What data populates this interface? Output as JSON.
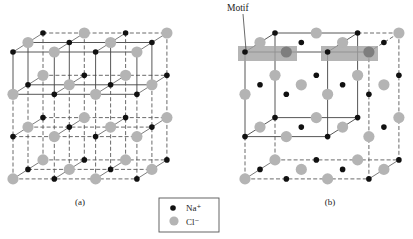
{
  "figure": {
    "canvas": {
      "width": 413,
      "height": 239,
      "background": "#ffffff"
    },
    "colors": {
      "na_atom": "#111111",
      "cl_atom": "#b4b4b4",
      "cl_atom_in_motif": "#7e7e7e",
      "line": "#444444",
      "dashed_line": "#5a5a5a",
      "motif_box": "#a3a3a3",
      "legend_border": "#555555"
    },
    "atom_radius": {
      "na": 2.8,
      "cl": 5.6
    },
    "lattice": {
      "size": {
        "x": 4,
        "y": 4,
        "z": 3
      },
      "step_x": [
        41.3,
        0
      ],
      "step_y": [
        0,
        42.3
      ],
      "step_z": [
        15,
        -9.5
      ],
      "coloring_rule": "Na+ where (i+j+k) is even, Cl- otherwise"
    },
    "panels": [
      {
        "id": "a",
        "label": "(a)",
        "label_pos": [
          80,
          205
        ],
        "origin": [
          13,
          52
        ],
        "edges": [
          {
            "axis": "x",
            "range": [
              0,
              3
            ],
            "at": [
              [
                0,
                1
              ],
              [
                0,
                1
              ]
            ],
            "style": "solid"
          },
          {
            "axis": "x",
            "range": [
              0,
              3
            ],
            "at": [
              [
                0,
                1
              ],
              [
                2
              ]
            ],
            "style": "dashed"
          },
          {
            "axis": "x",
            "range": [
              0,
              3
            ],
            "at": [
              [
                2,
                3
              ],
              [
                0,
                1,
                2
              ]
            ],
            "style": "dashed"
          },
          {
            "axis": "y",
            "range": [
              0,
              1
            ],
            "at": [
              [
                0,
                1,
                2,
                3
              ],
              [
                0,
                1
              ]
            ],
            "style": "solid"
          },
          {
            "axis": "y",
            "range": [
              0,
              1
            ],
            "at": [
              [
                0,
                1,
                2,
                3
              ],
              [
                2
              ]
            ],
            "style": "dashed"
          },
          {
            "axis": "y",
            "range": [
              1,
              3
            ],
            "at": [
              [
                0,
                1,
                2,
                3
              ],
              [
                0,
                1,
                2
              ]
            ],
            "style": "dashed"
          },
          {
            "axis": "z",
            "range": [
              0,
              2
            ],
            "at": [
              [
                0,
                1,
                2,
                3
              ],
              [
                0,
                1,
                2,
                3
              ]
            ],
            "style": "thin"
          }
        ],
        "motif_boxes": [],
        "motif_atoms": []
      },
      {
        "id": "b",
        "label": "(b)",
        "label_pos": [
          330,
          205
        ],
        "origin": [
          245,
          52
        ],
        "edges": [
          {
            "axis": "x",
            "range": [
              0,
              2
            ],
            "at": [
              [
                0,
                2
              ],
              [
                0,
                2
              ]
            ],
            "style": "solid"
          },
          {
            "axis": "y",
            "range": [
              0,
              2
            ],
            "at": [
              [
                0,
                2
              ],
              [
                0,
                2
              ]
            ],
            "style": "solid"
          },
          {
            "axis": "z",
            "range": [
              0,
              2
            ],
            "at": [
              [
                0,
                2
              ],
              [
                0,
                2
              ]
            ],
            "style": "solid"
          },
          {
            "axis": "y",
            "range": [
              2,
              3
            ],
            "at": [
              [
                0
              ],
              [
                0,
                2
              ]
            ],
            "style": "dashed"
          },
          {
            "axis": "y",
            "range": [
              0,
              3
            ],
            "at": [
              [
                3
              ],
              [
                0,
                2
              ]
            ],
            "style": "dashed"
          },
          {
            "axis": "x",
            "range": [
              0,
              3
            ],
            "at": [
              [
                3
              ],
              [
                0,
                2
              ]
            ],
            "style": "dashed"
          },
          {
            "axis": "x",
            "range": [
              2,
              3
            ],
            "at": [
              [
                0
              ],
              [
                2
              ]
            ],
            "style": "dashed"
          },
          {
            "axis": "x",
            "range": [
              2,
              3
            ],
            "at": [
              [
                0
              ],
              [
                0
              ]
            ],
            "style": "solid"
          },
          {
            "axis": "z",
            "range": [
              0,
              2
            ],
            "at": [
              [
                3
              ],
              [
                0
              ]
            ],
            "style": "dashed"
          },
          {
            "axis": "z",
            "range": [
              0,
              2
            ],
            "at": [
              [
                0,
                3
              ],
              [
                3
              ]
            ],
            "style": "thin"
          }
        ],
        "motif_boxes": [
          {
            "x": 238,
            "y": 46,
            "w": 59,
            "h": 15
          },
          {
            "x": 321,
            "y": 46,
            "w": 57,
            "h": 15
          }
        ],
        "motif_atoms": [
          [
            1,
            0,
            0
          ],
          [
            3,
            0,
            0
          ]
        ],
        "motif_label": {
          "text": "Motif",
          "pos": [
            227,
            11
          ],
          "leader": [
            [
              243,
              14
            ],
            [
              246,
              50
            ]
          ]
        }
      }
    ],
    "legend": {
      "box": {
        "x": 159,
        "y": 198,
        "w": 60,
        "h": 34
      },
      "items": [
        {
          "symbol": "na",
          "label": "Na⁺",
          "dot": [
            173,
            208
          ],
          "text_pos": [
            186,
            211
          ]
        },
        {
          "symbol": "cl",
          "label": "Cl⁻",
          "dot": [
            174,
            221
          ],
          "text_pos": [
            186,
            225
          ]
        }
      ]
    }
  }
}
